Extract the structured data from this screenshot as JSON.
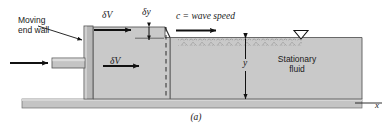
{
  "figure": {
    "caption": "(a)",
    "labels": {
      "moving_end_wall_line1": "Moving",
      "moving_end_wall_line2": "end wall",
      "delta_v_top": "δV",
      "delta_v_inner": "δV",
      "delta_y": "δy",
      "wave_speed": "c = wave speed",
      "depth": "y",
      "stationary_fluid_line1": "Stationary",
      "stationary_fluid_line2": "fluid",
      "x_axis": "x"
    },
    "icons": {
      "free_surface_marker": "free-surface-triangle-icon",
      "inflow_arrow": "left-inflow-arrow-icon",
      "wave_arrow": "wave-direction-arrow-icon",
      "velocity_arrow_top": "velocity-arrow-icon",
      "velocity_arrow_inner": "velocity-arrow-icon",
      "depth_dimension": "depth-dimension-arrow-icon",
      "delta_y_dimension": "delta-y-dimension-arrow-icon",
      "leader_line": "leader-line-icon"
    },
    "colors": {
      "fluid_fill": "#c9c9c9",
      "wall_fill": "#b8b8b8",
      "ground_fill": "#c4c4c4",
      "outline": "#4d4d4d",
      "ink": "#1a1a1a",
      "background": "#ffffff"
    }
  }
}
